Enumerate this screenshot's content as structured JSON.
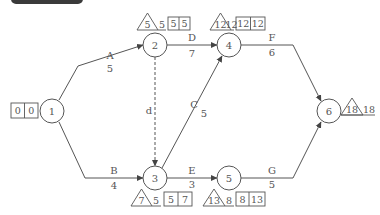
{
  "colors": {
    "line": "#555555",
    "text": "#555555",
    "header": "#3a3a3a"
  },
  "nodes": [
    {
      "id": "1",
      "x": 52,
      "y": 111
    },
    {
      "id": "2",
      "x": 155,
      "y": 45
    },
    {
      "id": "3",
      "x": 155,
      "y": 178
    },
    {
      "id": "4",
      "x": 229,
      "y": 45
    },
    {
      "id": "5",
      "x": 229,
      "y": 178
    },
    {
      "id": "6",
      "x": 329,
      "y": 111
    }
  ],
  "activities": [
    {
      "name": "A",
      "duration": "5",
      "from": "1",
      "to": "2"
    },
    {
      "name": "B",
      "duration": "4",
      "from": "1",
      "to": "3"
    },
    {
      "name": "C",
      "duration": "5",
      "from": "3",
      "to": "4"
    },
    {
      "name": "d",
      "duration": "",
      "from": "2",
      "to": "3",
      "dummy": true
    },
    {
      "name": "D",
      "duration": "7",
      "from": "2",
      "to": "4"
    },
    {
      "name": "E",
      "duration": "3",
      "from": "3",
      "to": "5"
    },
    {
      "name": "F",
      "duration": "6",
      "from": "4",
      "to": "6"
    },
    {
      "name": "G",
      "duration": "5",
      "from": "5",
      "to": "6"
    }
  ],
  "annotations": {
    "node1": {
      "box_left": "0",
      "box_right": "0"
    },
    "node2": {
      "tri": "5",
      "tri_after": "5",
      "box_left": "5",
      "box_right": "5"
    },
    "node3": {
      "tri": "7",
      "tri_after": "5",
      "box_left": "5",
      "box_right": "7"
    },
    "node4": {
      "tri": "12",
      "tri_after": "12",
      "box_left": "12",
      "box_right": "12"
    },
    "node5": {
      "tri": "13",
      "tri_after": "8",
      "box_left": "8",
      "box_right": "13"
    },
    "node6": {
      "tri": "18",
      "tri_after": "18"
    }
  }
}
